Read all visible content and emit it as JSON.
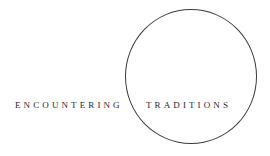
{
  "logo": {
    "word_left": "ENCOUNTERING",
    "word_right": "TRADITIONS",
    "colors": {
      "text": "#2a2a2a",
      "circle": "#3a3a3a",
      "background": "#ffffff"
    }
  }
}
